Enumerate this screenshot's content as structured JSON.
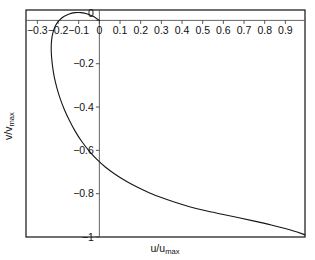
{
  "chart_data": {
    "type": "line",
    "title": "",
    "subtitle": "",
    "xlabel": "u/umax",
    "xlabel_base": "u/u",
    "xlabel_sub": "max",
    "ylabel": "v/vmax",
    "ylabel_base": "v/v",
    "ylabel_sub": "max",
    "xlim": [
      -0.355,
      0.995
    ],
    "ylim": [
      -1.0,
      0.048
    ],
    "xticks": [
      -0.3,
      -0.2,
      -0.1,
      0,
      0.1,
      0.2,
      0.3,
      0.4,
      0.5,
      0.6,
      0.7,
      0.8,
      0.9
    ],
    "xticklabels": [
      "-0.3",
      "-0.2",
      "-0.1",
      "0",
      "0.1",
      "0.2",
      "0.3",
      "0.4",
      "0.5",
      "0.6",
      "0.7",
      "0.8",
      "0.9"
    ],
    "yticks": [
      0,
      -0.2,
      -0.4,
      -0.6,
      -0.8,
      -1
    ],
    "yticklabels": [
      "0",
      "-0.2",
      "-0.4",
      "-0.6",
      "-0.8",
      "-1"
    ],
    "grid": false,
    "legend": null,
    "legend_position": "none",
    "curve_color": "#151515",
    "frame_color": "#111111",
    "axis_color": "#555555",
    "series": [
      {
        "name": "hodograph",
        "x": [
          0.0,
          -0.028,
          -0.058,
          -0.088,
          -0.118,
          -0.146,
          -0.172,
          -0.194,
          -0.212,
          -0.224,
          -0.231,
          -0.233,
          -0.231,
          -0.226,
          -0.218,
          -0.206,
          -0.19,
          -0.17,
          -0.146,
          -0.118,
          -0.086,
          -0.05,
          -0.012,
          0.03,
          0.076,
          0.126,
          0.18,
          0.238,
          0.3,
          0.366,
          0.436,
          0.51,
          0.588,
          0.67,
          0.756,
          0.846,
          0.94,
          0.995
        ],
        "y": [
          0.0,
          0.018,
          0.03,
          0.036,
          0.036,
          0.03,
          0.018,
          0.0,
          -0.024,
          -0.054,
          -0.09,
          -0.13,
          -0.172,
          -0.216,
          -0.262,
          -0.31,
          -0.36,
          -0.41,
          -0.46,
          -0.51,
          -0.558,
          -0.602,
          -0.642,
          -0.678,
          -0.71,
          -0.74,
          -0.768,
          -0.794,
          -0.818,
          -0.84,
          -0.86,
          -0.878,
          -0.894,
          -0.91,
          -0.928,
          -0.948,
          -0.972,
          -0.99
        ]
      }
    ]
  },
  "plotbox": {
    "left": 26,
    "top": 10,
    "right": 305,
    "bottom": 237
  }
}
